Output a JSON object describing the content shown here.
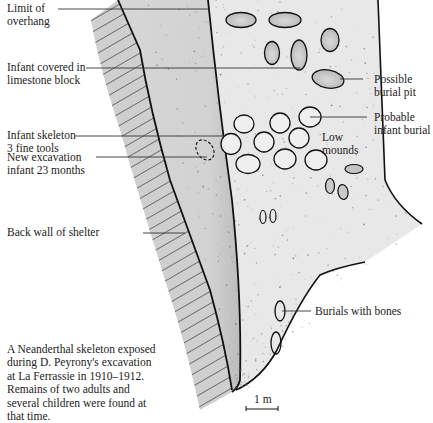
{
  "labels": {
    "limit_of_overhang": "Limit of\noverhang",
    "infant_limestone": "Infant covered in\nlimestone block",
    "infant_skeleton": "Infant skeleton\n3 fine tools",
    "new_excavation": "New excavation\ninfant 23 months",
    "back_wall": "Back wall of shelter",
    "possible_burial_pit": "Possible\nburial pit",
    "probable_infant_burial": "Probable\ninfant burial",
    "low_mounds": "Low\nmounds",
    "burials_with_bones": "Burials with bones"
  },
  "caption": "A Neanderthal skeleton exposed during D. Peyrony's excavation at La Ferrassie in 1910–1912. Remains of two adults and several children were found at that time.",
  "scale_bar": {
    "label": "1 m"
  },
  "colors": {
    "wall_fill": "#cfcfcf",
    "overhang_fill": "#d9d9d9",
    "floor_fill": "#e6e6e6",
    "outline": "#111111",
    "pit_fill": "#c8c8c8"
  }
}
